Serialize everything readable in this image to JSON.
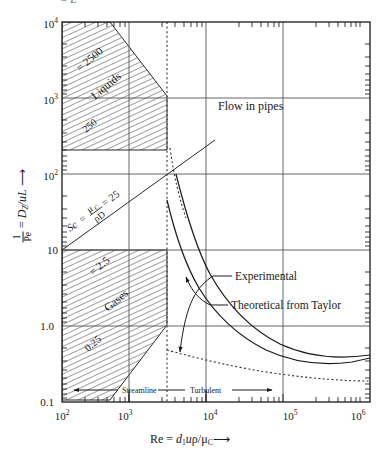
{
  "figure": {
    "top_fragment": "= L",
    "region_label_main": "Flow in pipes"
  },
  "axes": {
    "y": {
      "title_inv": "1",
      "title_pe": "Pe",
      "title_rest": " = D",
      "title_sub": "Z",
      "title_tail": "/uL",
      "title_arrow": "⟶",
      "ticks": [
        "10",
        "10",
        "10",
        "10",
        "1.0",
        "0.1"
      ],
      "tick_exponents": [
        "4",
        "3",
        "2",
        "",
        "",
        ""
      ],
      "min": 0.1,
      "max": 10000,
      "scale": "log"
    },
    "x": {
      "title_lead": "Re = ",
      "title_d": "d",
      "title_d_sub": "1",
      "title_u": "u",
      "title_rho": "ρ",
      "title_slash": "/",
      "title_mu": "μ",
      "title_mu_sub": "C",
      "title_arrow": "⟶",
      "ticks": [
        "10",
        "10",
        "10",
        "10",
        "10"
      ],
      "tick_exponents": [
        "2",
        "3",
        "4",
        "5",
        "6"
      ],
      "min": 100,
      "max": 1000000,
      "scale": "log"
    }
  },
  "regimes": {
    "streamline": "Streamline",
    "turbulent": "Turbulent",
    "transition_re": 2100
  },
  "bands": {
    "liquids": {
      "name": "Liquids",
      "upper_label": "= 2500",
      "lower_label": "250"
    },
    "gases": {
      "name": "Gases",
      "upper_label": "= 2.5",
      "lower_label": "0.25"
    },
    "schmidt": {
      "sc": "Sc",
      "eq": " = ",
      "num": "μ",
      "num_sub": "C",
      "den": "ρD",
      "value": " = 25"
    }
  },
  "annotations": {
    "experimental": "Experimental",
    "theoretical": "Theoretical from Taylor"
  },
  "chart_data": {
    "type": "line",
    "title": "Flow in pipes",
    "xlabel": "Re = d1uρ/μC",
    "ylabel": "1/Pe = DZ/uL",
    "xlim": [
      100,
      1000000
    ],
    "ylim": [
      0.1,
      10000
    ],
    "xscale": "log",
    "yscale": "log",
    "grid": true,
    "legend": "none",
    "annotations": [
      "Experimental",
      "Theoretical from Taylor",
      "Flow in pipes",
      "Streamline",
      "Turbulent"
    ],
    "series": [
      {
        "name": "Experimental",
        "style": "solid",
        "x": [
          2100,
          2600,
          3200,
          4500,
          7000,
          12000,
          25000,
          60000,
          150000,
          400000,
          1000000
        ],
        "y": [
          800,
          320,
          150,
          55,
          18,
          6.0,
          2.2,
          0.95,
          0.55,
          0.42,
          0.5
        ]
      },
      {
        "name": "Theoretical from Taylor",
        "style": "solid",
        "x": [
          2100,
          2600,
          3400,
          5000,
          8000,
          15000,
          35000,
          90000,
          250000,
          700000,
          1000000
        ],
        "y": [
          260,
          110,
          48,
          17,
          6.5,
          2.4,
          1.0,
          0.55,
          0.42,
          0.45,
          0.5
        ]
      },
      {
        "name": "Streamline extension upper",
        "style": "dotted",
        "x": [
          2100,
          2200,
          2600,
          3400,
          5200
        ],
        "y": [
          3000,
          1500,
          600,
          200,
          60
        ]
      },
      {
        "name": "Lower asymptote",
        "style": "dotted",
        "x": [
          2100,
          4000,
          10000,
          30000,
          100000,
          300000
        ],
        "y": [
          0.42,
          0.36,
          0.3,
          0.26,
          0.23,
          0.22
        ]
      }
    ],
    "bands": [
      {
        "name": "Liquids",
        "sc_range": [
          250,
          2500
        ],
        "shading": "hatched"
      },
      {
        "name": "Gases",
        "sc_range": [
          0.25,
          2.5
        ],
        "shading": "hatched"
      }
    ]
  }
}
